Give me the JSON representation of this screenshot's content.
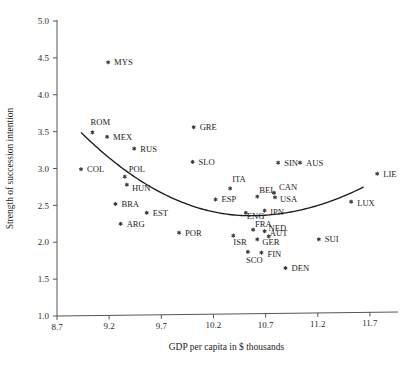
{
  "chart_data": {
    "type": "scatter",
    "title": "",
    "xlabel": "GDP per capita in $ thousands",
    "ylabel": "Strength of succession intention",
    "xlim": [
      8.7,
      11.95
    ],
    "ylim": [
      1.0,
      5.0
    ],
    "xticks": [
      "8.7",
      "9.2",
      "9.7",
      "10.2",
      "10.7",
      "11.2",
      "11.7"
    ],
    "xtick_values": [
      8.7,
      9.2,
      9.7,
      10.2,
      10.7,
      11.2,
      11.7
    ],
    "yticks": [
      "1.0",
      "1.5",
      "2.0",
      "2.5",
      "3.0",
      "3.5",
      "4.0",
      "4.5",
      "5.0"
    ],
    "ytick_values": [
      1.0,
      1.5,
      2.0,
      2.5,
      3.0,
      3.5,
      4.0,
      4.5,
      5.0
    ],
    "grid": false,
    "legend": "none",
    "marker_symbol": "asterisk",
    "points": [
      {
        "label": "MYS",
        "x": 9.19,
        "y": 4.44,
        "label_dx": 6,
        "label_dy": 3
      },
      {
        "label": "ROM",
        "x": 9.04,
        "y": 3.49,
        "label_dx": -2,
        "label_dy": -7
      },
      {
        "label": "GRE",
        "x": 10.01,
        "y": 3.56,
        "label_dx": 6,
        "label_dy": 3
      },
      {
        "label": "MEX",
        "x": 9.18,
        "y": 3.43,
        "label_dx": 6,
        "label_dy": 3
      },
      {
        "label": "RUS",
        "x": 9.44,
        "y": 3.27,
        "label_dx": 6,
        "label_dy": 3
      },
      {
        "label": "SLO",
        "x": 10.0,
        "y": 3.09,
        "label_dx": 6,
        "label_dy": 3
      },
      {
        "label": "SIN",
        "x": 10.82,
        "y": 3.08,
        "label_dx": 6,
        "label_dy": 3
      },
      {
        "label": "AUS",
        "x": 11.03,
        "y": 3.08,
        "label_dx": 6,
        "label_dy": 3
      },
      {
        "label": "COL",
        "x": 8.93,
        "y": 2.99,
        "label_dx": 6,
        "label_dy": 3
      },
      {
        "label": "LIE",
        "x": 11.77,
        "y": 2.93,
        "label_dx": 6,
        "label_dy": 3
      },
      {
        "label": "POL",
        "x": 9.35,
        "y": 2.89,
        "label_dx": 4,
        "label_dy": -5
      },
      {
        "label": "HUN",
        "x": 9.37,
        "y": 2.78,
        "label_dx": 5,
        "label_dy": 6
      },
      {
        "label": "ITA",
        "x": 10.36,
        "y": 2.73,
        "label_dx": 2,
        "label_dy": -6
      },
      {
        "label": "CAN",
        "x": 10.78,
        "y": 2.67,
        "label_dx": 5,
        "label_dy": -3
      },
      {
        "label": "BEL",
        "x": 10.62,
        "y": 2.62,
        "label_dx": 2,
        "label_dy": -4
      },
      {
        "label": "USA",
        "x": 10.79,
        "y": 2.61,
        "label_dx": 5,
        "label_dy": 5
      },
      {
        "label": "ESP",
        "x": 10.22,
        "y": 2.58,
        "label_dx": 6,
        "label_dy": 3
      },
      {
        "label": "LUX",
        "x": 11.52,
        "y": 2.55,
        "label_dx": 6,
        "label_dy": 4
      },
      {
        "label": "BRA",
        "x": 9.26,
        "y": 2.52,
        "label_dx": 6,
        "label_dy": 3
      },
      {
        "label": "JPN",
        "x": 10.69,
        "y": 2.43,
        "label_dx": 5,
        "label_dy": 4
      },
      {
        "label": "ENG",
        "x": 10.51,
        "y": 2.4,
        "label_dx": 1,
        "label_dy": 6
      },
      {
        "label": "EST",
        "x": 9.56,
        "y": 2.4,
        "label_dx": 6,
        "label_dy": 3
      },
      {
        "label": "ARG",
        "x": 9.31,
        "y": 2.25,
        "label_dx": 6,
        "label_dy": 3
      },
      {
        "label": "FRA",
        "x": 10.58,
        "y": 2.17,
        "label_dx": 2,
        "label_dy": -3
      },
      {
        "label": "NED",
        "x": 10.69,
        "y": 2.15,
        "label_dx": 4,
        "label_dy": 0
      },
      {
        "label": "POR",
        "x": 9.87,
        "y": 2.13,
        "label_dx": 6,
        "label_dy": 3
      },
      {
        "label": "AUT",
        "x": 10.73,
        "y": 2.08,
        "label_dx": 1,
        "label_dy": 0
      },
      {
        "label": "ISR",
        "x": 10.39,
        "y": 2.09,
        "label_dx": 0,
        "label_dy": 9
      },
      {
        "label": "GER",
        "x": 10.62,
        "y": 2.04,
        "label_dx": 5,
        "label_dy": 6
      },
      {
        "label": "SUI",
        "x": 11.21,
        "y": 2.04,
        "label_dx": 6,
        "label_dy": 3
      },
      {
        "label": "SCO",
        "x": 10.53,
        "y": 1.87,
        "label_dx": -2,
        "label_dy": 11
      },
      {
        "label": "FIN",
        "x": 10.66,
        "y": 1.86,
        "label_dx": 6,
        "label_dy": 4
      },
      {
        "label": "DEN",
        "x": 10.89,
        "y": 1.65,
        "label_dx": 6,
        "label_dy": 3
      }
    ],
    "fit_curve": {
      "description": "quadratic trend line",
      "x_start": 8.93,
      "x_end": 11.64,
      "vertex_x": 10.55,
      "vertex_y": 2.36,
      "y_start": 3.49,
      "y_end": 2.75
    }
  }
}
